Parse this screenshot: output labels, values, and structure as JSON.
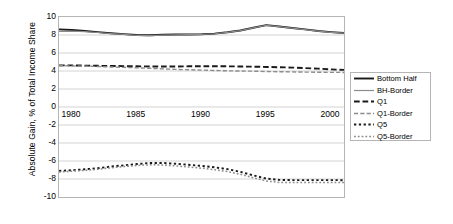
{
  "chart_data": {
    "type": "line",
    "title": "",
    "xlabel": "",
    "ylabel": "Absolute Gain, % of Total Income Share",
    "xlim": [
      1979,
      2001
    ],
    "ylim": [
      -10,
      10
    ],
    "ytick_step": 2,
    "grid": true,
    "grid_axis": "y",
    "legend_position": "right",
    "x": [
      1979,
      1980,
      1981,
      1982,
      1983,
      1984,
      1985,
      1986,
      1987,
      1988,
      1989,
      1990,
      1991,
      1992,
      1993,
      1994,
      1995,
      1996,
      1997,
      1998,
      1999,
      2000,
      2001
    ],
    "xtick_labels": [
      "1980",
      "1985",
      "1990",
      "1995",
      "2000"
    ],
    "xtick_values": [
      1980,
      1985,
      1990,
      1995,
      2000
    ],
    "ytick_labels": [
      "10",
      "8",
      "6",
      "4",
      "2",
      "0",
      "-2",
      "-4",
      "-6",
      "-8",
      "-10"
    ],
    "ytick_values": [
      10,
      8,
      6,
      4,
      2,
      0,
      -2,
      -4,
      -6,
      -8,
      -10
    ],
    "series": [
      {
        "name": "Bottom Half",
        "color": "#1a1a1a",
        "style": "solid",
        "width": 1.9,
        "values": [
          8.62,
          8.55,
          8.45,
          8.32,
          8.2,
          8.1,
          8.0,
          7.98,
          8.02,
          8.05,
          8.06,
          8.08,
          8.15,
          8.3,
          8.5,
          8.8,
          9.1,
          8.95,
          8.78,
          8.62,
          8.45,
          8.32,
          8.22
        ]
      },
      {
        "name": "BH-Border",
        "color": "#8c8c8c",
        "style": "solid",
        "width": 1.2,
        "values": [
          8.4,
          8.42,
          8.38,
          8.28,
          8.16,
          8.06,
          7.96,
          7.94,
          7.99,
          8.03,
          8.04,
          8.07,
          8.14,
          8.29,
          8.49,
          8.79,
          9.08,
          8.93,
          8.76,
          8.6,
          8.43,
          8.3,
          8.2
        ]
      },
      {
        "name": "Q1",
        "color": "#1a1a1a",
        "style": "dashed",
        "width": 1.9,
        "values": [
          4.62,
          4.62,
          4.6,
          4.58,
          4.56,
          4.54,
          4.52,
          4.5,
          4.5,
          4.5,
          4.52,
          4.52,
          4.52,
          4.52,
          4.5,
          4.48,
          4.45,
          4.42,
          4.38,
          4.32,
          4.26,
          4.18,
          4.12
        ]
      },
      {
        "name": "Q1-Border",
        "color": "#8c8c8c",
        "style": "dashed",
        "width": 1.4,
        "values": [
          4.58,
          4.57,
          4.54,
          4.5,
          4.45,
          4.4,
          4.36,
          4.3,
          4.24,
          4.18,
          4.14,
          4.1,
          4.06,
          4.02,
          4.0,
          3.98,
          3.94,
          3.92,
          3.9,
          3.88,
          3.86,
          3.85,
          3.84
        ]
      },
      {
        "name": "Q5",
        "color": "#1a1a1a",
        "style": "dotted",
        "width": 1.9,
        "values": [
          -7.1,
          -7.02,
          -6.92,
          -6.8,
          -6.62,
          -6.48,
          -6.34,
          -6.22,
          -6.22,
          -6.3,
          -6.42,
          -6.55,
          -6.7,
          -6.9,
          -7.2,
          -7.6,
          -7.95,
          -8.1,
          -8.12,
          -8.12,
          -8.12,
          -8.12,
          -8.14
        ]
      },
      {
        "name": "Q5-Border",
        "color": "#8c8c8c",
        "style": "dotted",
        "width": 1.5,
        "values": [
          -7.22,
          -7.14,
          -7.04,
          -6.92,
          -6.76,
          -6.62,
          -6.5,
          -6.42,
          -6.44,
          -6.54,
          -6.66,
          -6.8,
          -6.96,
          -7.18,
          -7.48,
          -7.86,
          -8.22,
          -8.38,
          -8.4,
          -8.4,
          -8.4,
          -8.4,
          -8.4
        ]
      }
    ]
  },
  "legend": {
    "items": [
      {
        "label": "Bottom Half"
      },
      {
        "label": "BH-Border"
      },
      {
        "label": "Q1"
      },
      {
        "label": "Q1-Border"
      },
      {
        "label": "Q5"
      },
      {
        "label": "Q5-Border"
      }
    ]
  },
  "colors": {
    "series_dark": "#1a1a1a",
    "series_gray": "#8c8c8c",
    "grid": "#c8c8c8",
    "border": "#b5b5b5",
    "background": "#ffffff"
  }
}
